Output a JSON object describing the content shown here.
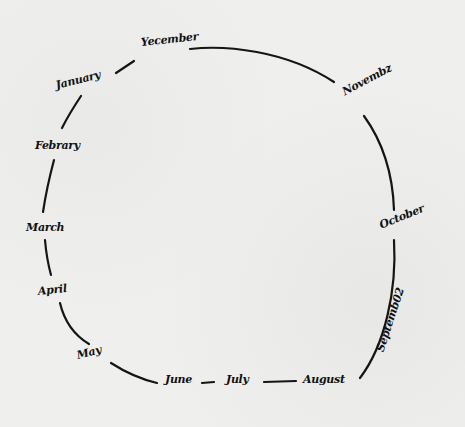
{
  "diagram": {
    "type": "cycle",
    "style": "hand-drawn",
    "stroke_color": "#151515",
    "background_color": "#efefed",
    "nodes": [
      {
        "id": "december",
        "label": "Yecember"
      },
      {
        "id": "november",
        "label": "Novembz"
      },
      {
        "id": "october",
        "label": "October"
      },
      {
        "id": "september",
        "label": "Septemb02"
      },
      {
        "id": "august",
        "label": "August"
      },
      {
        "id": "july",
        "label": "July"
      },
      {
        "id": "june",
        "label": "June"
      },
      {
        "id": "may",
        "label": "May"
      },
      {
        "id": "april",
        "label": "April"
      },
      {
        "id": "march",
        "label": "March"
      },
      {
        "id": "february",
        "label": "Febrary"
      },
      {
        "id": "january",
        "label": "January"
      }
    ],
    "edges": [
      [
        "december",
        "november"
      ],
      [
        "november",
        "october"
      ],
      [
        "october",
        "september"
      ],
      [
        "september",
        "august"
      ],
      [
        "august",
        "july"
      ],
      [
        "july",
        "june"
      ],
      [
        "june",
        "may"
      ],
      [
        "may",
        "april"
      ],
      [
        "april",
        "march"
      ],
      [
        "march",
        "february"
      ],
      [
        "february",
        "january"
      ],
      [
        "january",
        "december"
      ]
    ]
  }
}
